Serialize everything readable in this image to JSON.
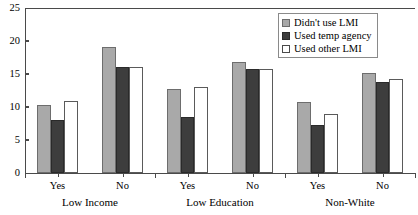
{
  "chart_data": {
    "type": "bar",
    "title": "",
    "subtitle": "",
    "xlabel": "",
    "ylabel": "",
    "ylim": [
      0,
      25
    ],
    "yticks": [
      0,
      5,
      10,
      15,
      20,
      25
    ],
    "ytick_labels": [
      "0",
      "5",
      "10",
      "15",
      "20",
      "25"
    ],
    "grid": false,
    "legend_position": "top-right",
    "categories": [
      "Yes",
      "No",
      "Yes",
      "No",
      "Yes",
      "No"
    ],
    "groups": [
      {
        "label": "Low Income",
        "categories": [
          "Yes",
          "No"
        ]
      },
      {
        "label": "Low Education",
        "categories": [
          "Yes",
          "No"
        ]
      },
      {
        "label": "Non-White",
        "categories": [
          "Yes",
          "No"
        ]
      }
    ],
    "series": [
      {
        "name": "Didn't use LMI",
        "color": "#a9a9a9",
        "values": [
          10.3,
          19.1,
          12.7,
          16.8,
          10.7,
          15.1
        ]
      },
      {
        "name": "Used temp agency",
        "color": "#3d3d3d",
        "values": [
          8.0,
          16.1,
          8.5,
          15.7,
          7.3,
          13.8
        ]
      },
      {
        "name": "Used other LMI",
        "color": "#ffffff",
        "values": [
          10.9,
          16.1,
          13.1,
          15.8,
          9.0,
          14.3
        ]
      }
    ]
  },
  "legend": {
    "items": [
      {
        "label": "Didn't use LMI"
      },
      {
        "label": "Used temp agency"
      },
      {
        "label": "Used other LMI"
      }
    ]
  }
}
